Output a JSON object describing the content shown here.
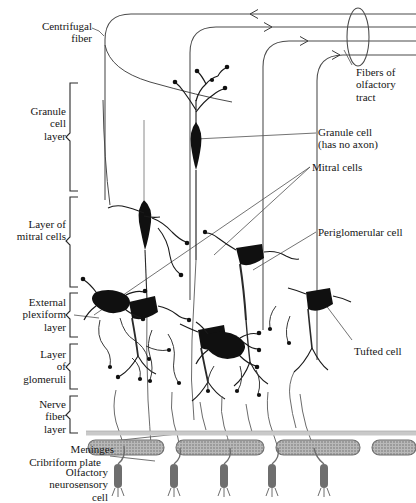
{
  "figure": {
    "ink_color": "#1a1a1a",
    "soma_color": "#101010",
    "plate_fill": "#b9b9b9",
    "receptor_color": "#6e6e6e",
    "meninges_color": "#c9c9c9"
  },
  "labels": {
    "centrifugal_fiber": "Centrifugal\nfiber",
    "granule_cell_layer": "Granule\ncell\nlayer",
    "layer_of_mitral_cells": "Layer of\nmitral cells",
    "external_plexiform_layer": "External\nplexiform\nlayer",
    "layer_of_glomeruli": "Layer\nof\nglomeruli",
    "nerve_fiber_layer": "Nerve\nfiber\nlayer",
    "meninges": "Meninges",
    "cribriform_plate": "Cribriform plate",
    "olfactory_neurosensory_cell": "Olfactory\nneurosensory\ncell",
    "fibers_of_olfactory_tract": "Fibers of\nolfactory\ntract",
    "granule_cell": "Granule cell\n(has no axon)",
    "mitral_cells": "Mitral cells",
    "periglomerular_cell": "Periglomerular cell",
    "tufted_cell": "Tufted cell"
  },
  "structures": {
    "tract_fiber_count": 4,
    "tract_arrow_directions": [
      "left",
      "right",
      "right",
      "right"
    ],
    "cribriform_plate_segments": 4,
    "neurosensory_cell_count": 5,
    "mitral_cell_count": 3,
    "granule_cell_count": 2,
    "periglomerular_cell_count": 2,
    "tufted_cell_count": 1
  }
}
